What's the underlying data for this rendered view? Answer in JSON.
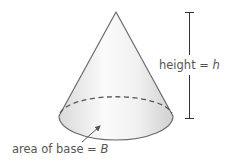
{
  "diagram": {
    "type": "cone",
    "labels": {
      "height_text": "height = ",
      "height_var": "h",
      "base_text": "area of base = ",
      "base_var": "B"
    },
    "colors": {
      "outline": "#6b6b6b",
      "fill_light": "#f7f7f7",
      "fill_dark": "#dcdcdc",
      "text": "#555555",
      "dimension_line": "#333333"
    }
  }
}
